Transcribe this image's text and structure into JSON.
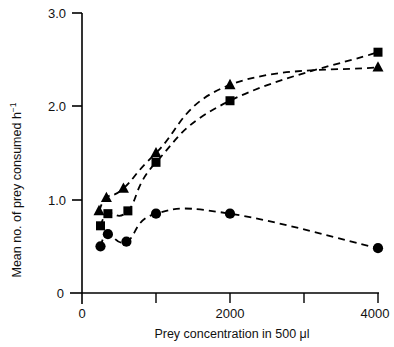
{
  "chart_data": {
    "type": "scatter",
    "title": "",
    "subtitle": "",
    "xlabel": "Prey concentration in 500 μl",
    "ylabel": "Mean no. of prey consumed h⁻¹",
    "ylabel_main": "Mean no. of prey consumed h",
    "ylabel_sup": "−1",
    "xlim": [
      0,
      4300
    ],
    "ylim": [
      0,
      3.0
    ],
    "grid": false,
    "legend": "none",
    "x_ticks": [
      0,
      1000,
      2000,
      3000,
      4000
    ],
    "x_tick_labels": [
      "0",
      "",
      "2000",
      "",
      "4000"
    ],
    "y_ticks": [
      0,
      1.0,
      2.0,
      3.0
    ],
    "y_tick_labels": [
      "0",
      "1.0",
      "2.0",
      "3.0"
    ],
    "marker_color": "#000000",
    "line_style": "dashed",
    "series": [
      {
        "name": "triangle-series",
        "marker": "triangle",
        "x": [
          230,
          330,
          560,
          1000,
          2000,
          4000
        ],
        "values": [
          0.88,
          1.02,
          1.12,
          1.5,
          2.23,
          2.42
        ]
      },
      {
        "name": "square-series",
        "marker": "square",
        "x": [
          250,
          350,
          620,
          1000,
          2000,
          4000
        ],
        "values": [
          0.72,
          0.85,
          0.88,
          1.4,
          2.06,
          2.58
        ]
      },
      {
        "name": "circle-series",
        "marker": "circle",
        "x": [
          250,
          350,
          600,
          1000,
          2000,
          4000
        ],
        "values": [
          0.5,
          0.63,
          0.55,
          0.85,
          0.85,
          0.48
        ]
      }
    ]
  },
  "axis": {
    "y_label_text": "Mean no. of prey consumed h",
    "y_label_superscript": "−1",
    "x_label_text": "Prey concentration in 500 μl",
    "y_tick_0": "0",
    "y_tick_1": "1.0",
    "y_tick_2": "2.0",
    "y_tick_3": "3.0",
    "x_tick_0": "0",
    "x_tick_2000": "2000",
    "x_tick_4000": "4000"
  }
}
